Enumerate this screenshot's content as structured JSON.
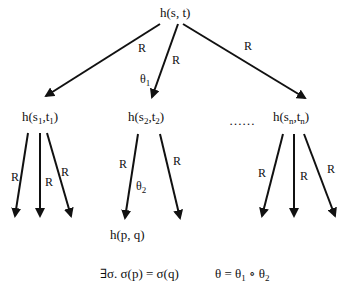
{
  "diagram": {
    "root": {
      "text": "h(s, t)"
    },
    "children": [
      {
        "fn": "h(",
        "s": "s",
        "s_sub": "1",
        "sep": ",",
        "t": "t",
        "t_sub": "1",
        "close": ")"
      },
      {
        "fn": "h(",
        "s": "s",
        "s_sub": "2",
        "sep": ",",
        "t": "t",
        "t_sub": "2",
        "close": ")"
      },
      {
        "fn": "h(",
        "s": "s",
        "s_sub": "n",
        "sep": ",",
        "t": "t",
        "t_sub": "n",
        "close": ")"
      }
    ],
    "ellipsis": "……",
    "leaf": {
      "text": "h(p, q)"
    },
    "edge_label": "R",
    "theta1": {
      "base": "θ",
      "sub": "1"
    },
    "theta2": {
      "base": "θ",
      "sub": "2"
    },
    "formula_left": "∃σ.  σ(p) = σ(q)",
    "formula_right": {
      "lhs": "θ  =  θ",
      "sub1": "1",
      "op": " ∘ θ",
      "sub2": "2"
    }
  }
}
